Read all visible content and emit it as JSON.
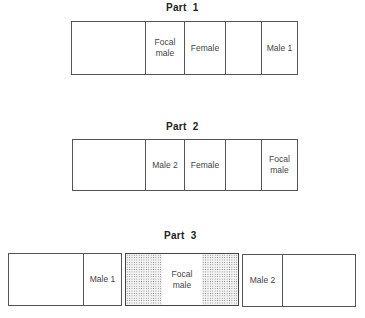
{
  "diagram": {
    "parts": [
      {
        "title": "Part  1",
        "cells": [
          {
            "label": ""
          },
          {
            "label": "Focal\nmale"
          },
          {
            "label": "Female"
          },
          {
            "label": ""
          },
          {
            "label": "Male 1"
          }
        ]
      },
      {
        "title": "Part  2",
        "cells": [
          {
            "label": ""
          },
          {
            "label": "Male 2"
          },
          {
            "label": "Female"
          },
          {
            "label": ""
          },
          {
            "label": "Focal\nmale"
          }
        ]
      },
      {
        "title": "Part  3",
        "boxes": [
          {
            "cells": [
              {
                "label": ""
              },
              {
                "label": "Male 1"
              }
            ]
          },
          {
            "cells": [
              {
                "label": "",
                "pattern": "stipple"
              },
              {
                "label": "Focal\nmale"
              },
              {
                "label": "",
                "pattern": "stipple"
              }
            ]
          },
          {
            "cells": [
              {
                "label": "Male 2"
              },
              {
                "label": ""
              }
            ]
          }
        ]
      }
    ],
    "colors": {
      "line": "#555555",
      "text": "#444444",
      "title": "#222222",
      "stipple": "#6a6a6a"
    }
  }
}
